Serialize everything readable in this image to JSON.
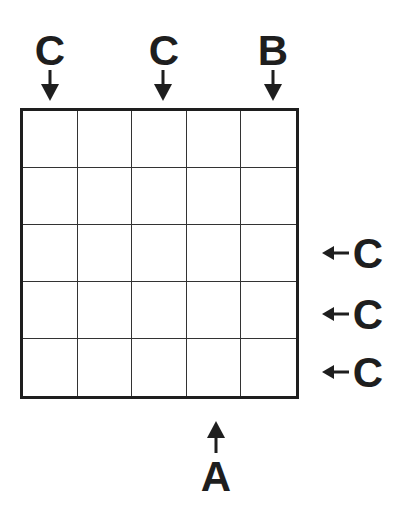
{
  "puzzle": {
    "rows": 5,
    "cols": 5,
    "cells": [
      [
        "",
        "",
        "",
        "",
        ""
      ],
      [
        "",
        "",
        "",
        "",
        ""
      ],
      [
        "",
        "",
        "",
        "",
        ""
      ],
      [
        "",
        "",
        "",
        "",
        ""
      ],
      [
        "",
        "",
        "",
        "",
        ""
      ]
    ],
    "top_clues": [
      {
        "col": 1,
        "label": "C",
        "arrow": "down-arrow"
      },
      {
        "col": 3,
        "label": "C",
        "arrow": "down-arrow"
      },
      {
        "col": 5,
        "label": "B",
        "arrow": "down-arrow"
      }
    ],
    "right_clues": [
      {
        "row": 3,
        "label": "C",
        "arrow": "left-arrow"
      },
      {
        "row": 4,
        "label": "C",
        "arrow": "left-arrow"
      },
      {
        "row": 5,
        "label": "C",
        "arrow": "left-arrow"
      }
    ],
    "bottom_clues": [
      {
        "col": 4,
        "label": "A",
        "arrow": "up-arrow"
      }
    ]
  },
  "colors": {
    "ink": "#1e1e1e",
    "background": "#ffffff",
    "gridline": "#333333"
  }
}
